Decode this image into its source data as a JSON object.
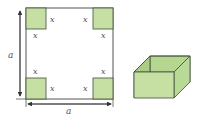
{
  "figure": {
    "sheet": {
      "side_label": "a",
      "bottom_label": "a",
      "cut_label": "x",
      "corners": [
        {
          "name": "top-left",
          "labels": [
            "x",
            "x"
          ]
        },
        {
          "name": "top-right",
          "labels": [
            "x",
            "x"
          ]
        },
        {
          "name": "bottom-left",
          "labels": [
            "x",
            "x"
          ]
        },
        {
          "name": "bottom-right",
          "labels": [
            "x",
            "x"
          ]
        }
      ]
    },
    "box": {
      "description": "open-top box formed by folding"
    },
    "colors": {
      "fill": "#c6e0a4",
      "fill_dark": "#a9cd82",
      "stroke": "#3f4f3a",
      "line": "#555555"
    }
  }
}
